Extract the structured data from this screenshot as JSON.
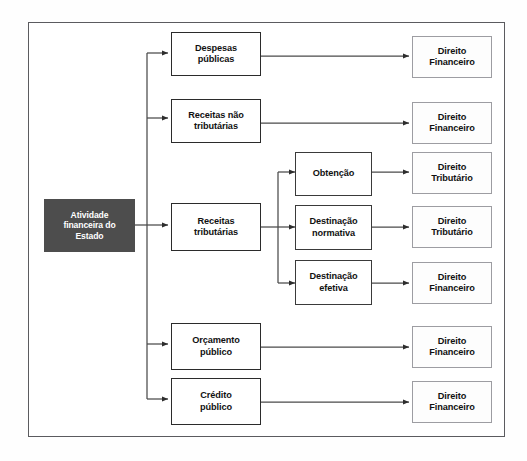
{
  "diagram": {
    "title": "Atividade financeira do Estado",
    "type": "tree-flowchart",
    "colors": {
      "root_fill": "#4d4d4d",
      "root_text": "#ffffff",
      "box_fill": "#ffffff",
      "box_text": "#111111",
      "mid_border": "#2b2b2b",
      "right_border": "#9d9da2",
      "frame_border": "#5b5b5f",
      "connector": "#4a4a4a",
      "canvas": "#ffffff"
    },
    "root": {
      "label": "Atividade\nfinanceira do\nEstado"
    },
    "branches": [
      {
        "label": "Despesas\npúblicas",
        "outcome": "Direito\nFinanceiro"
      },
      {
        "label": "Receitas não\ntributárias",
        "outcome": "Direito\nFinanceiro"
      },
      {
        "label": "Receitas\ntributárias",
        "children": [
          {
            "label": "Obtenção",
            "outcome": "Direito\nTributário"
          },
          {
            "label": "Destinação\nnormativa",
            "outcome": "Direito\nTributário"
          },
          {
            "label": "Destinação\nefetiva",
            "outcome": "Direito\nFinanceiro"
          }
        ]
      },
      {
        "label": "Orçamento\npúblico",
        "outcome": "Direito\nFinanceiro"
      },
      {
        "label": "Crédito\npúblico",
        "outcome": "Direito\nFinanceiro"
      }
    ]
  }
}
